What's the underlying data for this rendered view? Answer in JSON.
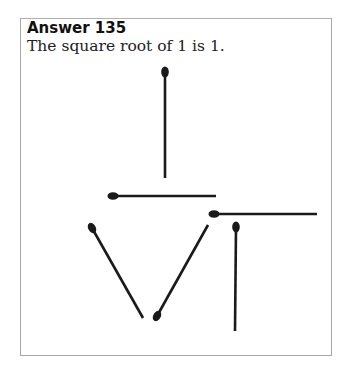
{
  "heading": "Answer 135",
  "text": "The square root of 1 is 1.",
  "colors": {
    "stick": "#1a1a1a",
    "frame": "#a8a8a8",
    "text": "#222222"
  },
  "matches": [
    {
      "name": "match-vertical-top",
      "head": [
        165,
        72
      ],
      "tail": [
        165,
        178
      ]
    },
    {
      "name": "match-horizontal-radical-bar",
      "head": [
        113,
        196
      ],
      "tail": [
        216,
        196
      ]
    },
    {
      "name": "match-horizontal-right",
      "head": [
        214,
        214
      ],
      "tail": [
        317,
        214
      ]
    },
    {
      "name": "match-vertical-right",
      "head": [
        236,
        227
      ],
      "tail": [
        235,
        331
      ]
    },
    {
      "name": "match-diagonal-left",
      "head": [
        92,
        228
      ],
      "tail": [
        143,
        318
      ]
    },
    {
      "name": "match-diagonal-right",
      "head": [
        157,
        316
      ],
      "tail": [
        208,
        225
      ]
    }
  ]
}
